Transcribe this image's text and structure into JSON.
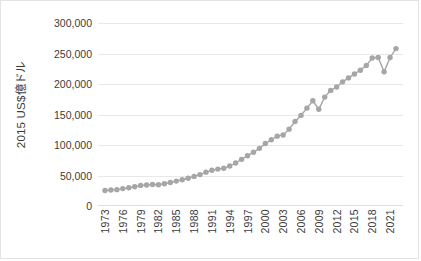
{
  "chart_data": {
    "type": "line",
    "title": "",
    "subtitle": "",
    "xlabel": "",
    "ylabel": "2015 US$億ドル",
    "ylim": [
      0,
      300000
    ],
    "ytick_values": [
      0,
      50000,
      100000,
      150000,
      200000,
      250000,
      300000
    ],
    "ytick_labels": [
      "0",
      "50,000",
      "100,000",
      "150,000",
      "200,000",
      "250,000",
      "300,000"
    ],
    "xtick_labels": [
      "1973",
      "1976",
      "1979",
      "1982",
      "1985",
      "1988",
      "1991",
      "1994",
      "1997",
      "2000",
      "2003",
      "2006",
      "2009",
      "2012",
      "2015",
      "2018",
      "2021"
    ],
    "xtick_step": 3,
    "grid": true,
    "legend": false,
    "legend_position": "none",
    "marker": "circle",
    "series_color": "#a6a6a6",
    "x": [
      1973,
      1974,
      1975,
      1976,
      1977,
      1978,
      1979,
      1980,
      1981,
      1982,
      1983,
      1984,
      1985,
      1986,
      1987,
      1988,
      1989,
      1990,
      1991,
      1992,
      1993,
      1994,
      1995,
      1996,
      1997,
      1998,
      1999,
      2000,
      2001,
      2002,
      2003,
      2004,
      2005,
      2006,
      2007,
      2008,
      2009,
      2010,
      2011,
      2012,
      2013,
      2014,
      2015,
      2016,
      2017,
      2018,
      2019,
      2020,
      2021,
      2022
    ],
    "values": [
      25500,
      26200,
      26800,
      28500,
      29800,
      31500,
      33800,
      34500,
      35200,
      34800,
      36500,
      38500,
      40800,
      43000,
      45500,
      48500,
      51500,
      55500,
      58500,
      60500,
      62000,
      65500,
      70500,
      76500,
      82500,
      88000,
      94500,
      102500,
      108500,
      114500,
      116500,
      126000,
      138500,
      148500,
      160500,
      172500,
      158500,
      178500,
      189500,
      195000,
      203500,
      210000,
      216500,
      222500,
      230500,
      242500,
      243500,
      220000,
      243500,
      258000
    ],
    "annotations": [
      {
        "x": 2009,
        "note": "global financial crisis dip"
      },
      {
        "x": 2020,
        "note": "pandemic dip"
      }
    ]
  }
}
